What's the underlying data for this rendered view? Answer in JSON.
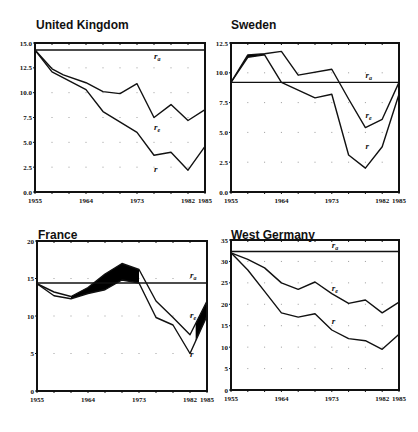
{
  "chart_data": [
    {
      "type": "line",
      "title": "United Kingdom",
      "xlabel": "",
      "ylabel": "",
      "xlim": [
        1955,
        1985
      ],
      "ylim": [
        0,
        15
      ],
      "x_ticks": [
        1955,
        1964,
        1973,
        1982,
        1985
      ],
      "y_ticks": [
        "0.0",
        "2.5",
        "5.0",
        "7.5",
        "10.0",
        "12.5",
        "15.0"
      ],
      "y_tick_values": [
        0,
        2.5,
        5,
        7.5,
        10,
        12.5,
        15
      ],
      "grid": "dotted",
      "legend": "inline labels",
      "series": [
        {
          "name": "r_a",
          "label_main": "r",
          "label_sub": "a",
          "x": [
            1955,
            1985
          ],
          "values": [
            14.3,
            14.3
          ],
          "label_at": [
            1976,
            13.4
          ]
        },
        {
          "name": "r_e",
          "label_main": "r",
          "label_sub": "e",
          "x": [
            1955,
            1958,
            1960,
            1964,
            1967,
            1970,
            1973,
            1976,
            1979,
            1982,
            1985
          ],
          "values": [
            14.3,
            12.4,
            11.8,
            11.0,
            10.1,
            9.9,
            10.9,
            7.5,
            8.8,
            7.2,
            8.3
          ],
          "label_at": [
            1976,
            6.2
          ]
        },
        {
          "name": "r",
          "label_main": "r",
          "label_sub": "",
          "x": [
            1955,
            1958,
            1964,
            1967,
            1973,
            1976,
            1979,
            1982,
            1985
          ],
          "values": [
            14.3,
            12.1,
            10.3,
            8.1,
            6.0,
            3.7,
            4.0,
            2.2,
            4.6
          ],
          "label_at": [
            1976,
            2.0
          ]
        }
      ],
      "shaded_between": []
    },
    {
      "type": "line",
      "title": "Sweden",
      "xlabel": "",
      "ylabel": "",
      "xlim": [
        1955,
        1985
      ],
      "ylim": [
        0,
        12.5
      ],
      "x_ticks": [
        1955,
        1964,
        1973,
        1982,
        1985
      ],
      "y_ticks": [
        "0.0",
        "2.5",
        "5.0",
        "7.5",
        "10.0",
        "12.5"
      ],
      "y_tick_values": [
        0,
        2.5,
        5,
        7.5,
        10,
        12.5
      ],
      "grid": "dotted",
      "legend": "inline labels",
      "series": [
        {
          "name": "r_a",
          "label_main": "r",
          "label_sub": "a",
          "x": [
            1955,
            1985
          ],
          "values": [
            9.2,
            9.2
          ],
          "label_at": [
            1979,
            9.6
          ]
        },
        {
          "name": "r_e",
          "label_main": "r",
          "label_sub": "e",
          "x": [
            1955,
            1958,
            1961,
            1964,
            1967,
            1973,
            1976,
            1979,
            1982,
            1985
          ],
          "values": [
            9.2,
            11.5,
            11.6,
            11.8,
            9.8,
            10.3,
            7.8,
            5.4,
            6.1,
            9.2
          ],
          "label_at": [
            1979,
            6.2
          ]
        },
        {
          "name": "r",
          "label_main": "r",
          "label_sub": "",
          "x": [
            1955,
            1958,
            1961,
            1964,
            1970,
            1973,
            1976,
            1979,
            1982,
            1985
          ],
          "values": [
            9.2,
            11.3,
            11.5,
            9.2,
            7.9,
            8.2,
            3.1,
            2.0,
            3.8,
            8.2
          ],
          "label_at": [
            1979,
            3.6
          ]
        }
      ],
      "shaded_between": [
        {
          "upper": "r_e",
          "lower": "r",
          "from": 1955,
          "to": 1961
        }
      ]
    },
    {
      "type": "line",
      "title": "France",
      "xlabel": "",
      "ylabel": "",
      "xlim": [
        1955,
        1985
      ],
      "ylim": [
        0,
        20
      ],
      "x_ticks": [
        1955,
        1964,
        1973,
        1982,
        1985
      ],
      "y_ticks": [
        "0",
        "5",
        "10",
        "15",
        "20"
      ],
      "y_tick_values": [
        0,
        5,
        10,
        15,
        20
      ],
      "grid": "dotted",
      "legend": "inline labels",
      "series": [
        {
          "name": "r_a",
          "label_main": "r",
          "label_sub": "a",
          "x": [
            1955,
            1985
          ],
          "values": [
            14.4,
            14.4
          ],
          "label_at": [
            1982,
            15.1
          ]
        },
        {
          "name": "r_e",
          "label_main": "r",
          "label_sub": "e",
          "x": [
            1955,
            1958,
            1961,
            1964,
            1967,
            1970,
            1973,
            1976,
            1979,
            1982,
            1985
          ],
          "values": [
            14.3,
            13.2,
            12.6,
            13.8,
            15.6,
            17.0,
            16.2,
            12.0,
            9.8,
            7.5,
            12.0
          ],
          "label_at": [
            1982,
            9.8
          ]
        },
        {
          "name": "r",
          "label_main": "r",
          "label_sub": "",
          "x": [
            1955,
            1958,
            1961,
            1964,
            1967,
            1970,
            1973,
            1976,
            1979,
            1982,
            1985
          ],
          "values": [
            14.3,
            12.7,
            12.3,
            13.0,
            13.5,
            14.8,
            14.4,
            9.8,
            8.8,
            5.0,
            10.0
          ],
          "label_at": [
            1982,
            4.6
          ]
        }
      ],
      "shaded_between": [
        {
          "upper": "r_e",
          "lower": "r",
          "from": 1961,
          "to": 1973
        },
        {
          "upper": "r_e",
          "lower": "r",
          "from": 1983,
          "to": 1985
        }
      ]
    },
    {
      "type": "line",
      "title": "West Germany",
      "xlabel": "",
      "ylabel": "",
      "xlim": [
        1955,
        1985
      ],
      "ylim": [
        0,
        35
      ],
      "x_ticks": [
        1955,
        1964,
        1973,
        1982,
        1985
      ],
      "y_ticks": [
        "0",
        "5",
        "10",
        "15",
        "20",
        "25",
        "30",
        "35"
      ],
      "y_tick_values": [
        0,
        5,
        10,
        15,
        20,
        25,
        30,
        35
      ],
      "grid": "dotted",
      "legend": "inline labels",
      "series": [
        {
          "name": "r_a",
          "label_main": "r",
          "label_sub": "a",
          "x": [
            1955,
            1985
          ],
          "values": [
            32.3,
            32.3
          ],
          "label_at": [
            1973,
            33.2
          ]
        },
        {
          "name": "r_e",
          "label_main": "r",
          "label_sub": "e",
          "x": [
            1955,
            1958,
            1961,
            1964,
            1967,
            1970,
            1973,
            1976,
            1979,
            1982,
            1985
          ],
          "values": [
            32,
            30.5,
            28.5,
            25,
            23.5,
            25.2,
            22.5,
            20.2,
            21,
            18,
            20.5
          ],
          "label_at": [
            1973,
            23.0
          ]
        },
        {
          "name": "r",
          "label_main": "r",
          "label_sub": "",
          "x": [
            1955,
            1958,
            1961,
            1964,
            1967,
            1970,
            1973,
            1976,
            1979,
            1982,
            1985
          ],
          "values": [
            32,
            28,
            23,
            18,
            17,
            17.8,
            14,
            12,
            11.5,
            9.5,
            13
          ],
          "label_at": [
            1973,
            15.5
          ]
        }
      ],
      "shaded_between": []
    }
  ],
  "layout": {
    "panels": [
      {
        "title_x": 36,
        "title_y": 6,
        "plot_left": 35,
        "plot_top": 43,
        "plot_right": 205,
        "plot_bottom": 192
      },
      {
        "title_x": 231,
        "title_y": 6,
        "plot_left": 231,
        "plot_top": 43,
        "plot_right": 399,
        "plot_bottom": 192
      },
      {
        "title_x": 38,
        "title_y": 216,
        "plot_left": 37,
        "plot_top": 241,
        "plot_right": 207,
        "plot_bottom": 391
      },
      {
        "title_x": 231,
        "title_y": 216,
        "plot_left": 231,
        "plot_top": 240,
        "plot_right": 399,
        "plot_bottom": 390
      }
    ],
    "line_color": "#111111",
    "fill_color": "#000000",
    "grid_color": "#9a9a9a"
  }
}
